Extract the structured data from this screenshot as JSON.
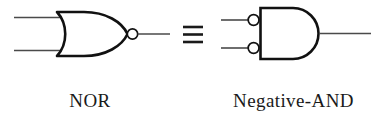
{
  "figure": {
    "type": "logic-gate-equivalence",
    "equivalence_symbol": "≡",
    "stroke_color": "#111111",
    "wire_color": "#4a4a4a",
    "background_color": "#ffffff",
    "left": {
      "name": "NOR",
      "label": "NOR",
      "shape": "or-gate",
      "inputs": 2,
      "input_bubbles": 0,
      "output_bubble": true,
      "outputs": 1
    },
    "right": {
      "name": "Negative-AND",
      "label": "Negative-AND",
      "shape": "and-gate",
      "inputs": 2,
      "input_bubbles": 2,
      "output_bubble": false,
      "outputs": 1
    }
  }
}
